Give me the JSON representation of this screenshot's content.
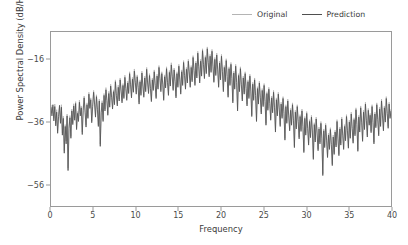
{
  "chart_data": {
    "type": "line",
    "title": "",
    "xlabel": "Frequency",
    "ylabel": "Power Spectral Density (dB/Hz)",
    "xlim": [
      0,
      40
    ],
    "ylim": [
      -63,
      -7
    ],
    "xticks": [
      0,
      5,
      10,
      15,
      20,
      25,
      30,
      35,
      40
    ],
    "xtick_labels": [
      "0",
      "5",
      "10",
      "15",
      "20",
      "25",
      "30",
      "35",
      "40"
    ],
    "yticks": [
      -16,
      -36,
      -56
    ],
    "ytick_labels": [
      "-16",
      "-36",
      "-56"
    ],
    "grid": false,
    "legend_position": "upper right",
    "series": [
      {
        "name": "Original",
        "color": "#b4b4b4",
        "linewidth": 0.8,
        "values": [
          -30.5,
          -33.2,
          -31.1,
          -34.8,
          -30.2,
          -36.4,
          -32.0,
          -38.9,
          -33.6,
          -31.2,
          -35.8,
          -30.4,
          -39.5,
          -34.1,
          -45.2,
          -36.8,
          -42.1,
          -33.4,
          -50.8,
          -37.2,
          -33.9,
          -40.6,
          -31.8,
          -36.2,
          -30.1,
          -34.7,
          -29.4,
          -37.8,
          -32.6,
          -35.1,
          -28.9,
          -33.4,
          -30.8,
          -39.2,
          -31.5,
          -27.6,
          -32.1,
          -36.9,
          -29.8,
          -34.2,
          -26.4,
          -31.0,
          -28.2,
          -35.6,
          -30.4,
          -25.8,
          -29.6,
          -33.8,
          -27.2,
          -31.4,
          -36.8,
          -28.6,
          -43.1,
          -32.4,
          -29.1,
          -35.2,
          -26.8,
          -31.8,
          -24.9,
          -28.4,
          -33.2,
          -26.1,
          -30.6,
          -23.8,
          -27.4,
          -31.2,
          -25.6,
          -29.8,
          -22.4,
          -26.8,
          -30.2,
          -24.1,
          -28.6,
          -21.8,
          -25.4,
          -29.2,
          -23.6,
          -27.8,
          -20.9,
          -24.6,
          -28.4,
          -22.8,
          -26.2,
          -19.8,
          -23.4,
          -27.6,
          -21.6,
          -25.8,
          -18.9,
          -22.6,
          -26.4,
          -20.8,
          -24.2,
          -29.6,
          -22.4,
          -26.8,
          -19.6,
          -23.8,
          -27.4,
          -21.2,
          -25.6,
          -18.4,
          -22.8,
          -26.2,
          -20.4,
          -24.6,
          -28.8,
          -21.8,
          -25.2,
          -19.2,
          -23.6,
          -27.8,
          -20.6,
          -24.8,
          -17.8,
          -21.4,
          -25.6,
          -19.8,
          -23.2,
          -28.4,
          -20.8,
          -24.4,
          -18.2,
          -22.6,
          -26.8,
          -19.4,
          -23.8,
          -16.9,
          -20.8,
          -25.2,
          -18.6,
          -22.4,
          -27.6,
          -19.8,
          -24.2,
          -17.4,
          -21.8,
          -26.4,
          -19.2,
          -23.6,
          -16.2,
          -20.4,
          -24.8,
          -18.4,
          -22.8,
          -15.8,
          -19.6,
          -24.2,
          -17.8,
          -22.4,
          -14.6,
          -18.8,
          -23.6,
          -16.4,
          -21.2,
          -13.2,
          -17.6,
          -22.8,
          -15.8,
          -20.6,
          -12.4,
          -16.8,
          -21.4,
          -14.6,
          -19.8,
          -11.8,
          -16.2,
          -20.8,
          -14.2,
          -19.4,
          -12.6,
          -17.4,
          -22.6,
          -15.2,
          -20.4,
          -13.8,
          -18.6,
          -24.2,
          -16.4,
          -21.8,
          -14.2,
          -19.2,
          -25.6,
          -17.8,
          -22.4,
          -15.6,
          -20.8,
          -27.4,
          -18.2,
          -23.6,
          -16.8,
          -21.4,
          -29.2,
          -19.6,
          -24.8,
          -17.4,
          -22.6,
          -31.8,
          -20.4,
          -25.6,
          -18.2,
          -23.4,
          -28.6,
          -21.2,
          -26.4,
          -19.8,
          -24.6,
          -30.2,
          -22.4,
          -27.8,
          -20.6,
          -25.4,
          -33.6,
          -23.2,
          -28.4,
          -21.8,
          -26.8,
          -35.2,
          -24.6,
          -29.6,
          -22.8,
          -27.4,
          -32.8,
          -25.2,
          -30.4,
          -23.6,
          -28.8,
          -36.4,
          -26.2,
          -31.6,
          -24.8,
          -29.4,
          -34.8,
          -27.6,
          -32.4,
          -25.8,
          -30.8,
          -38.6,
          -28.2,
          -33.4,
          -26.4,
          -31.2,
          -36.8,
          -29.6,
          -34.2,
          -27.8,
          -32.6,
          -41.2,
          -30.4,
          -35.8,
          -28.6,
          -33.4,
          -38.2,
          -31.6,
          -36.4,
          -29.8,
          -34.8,
          -43.6,
          -32.2,
          -37.6,
          -30.4,
          -35.2,
          -40.8,
          -33.6,
          -38.4,
          -31.8,
          -36.8,
          -45.2,
          -34.2,
          -39.6,
          -32.6,
          -37.4,
          -42.8,
          -35.2,
          -40.4,
          -33.8,
          -38.6,
          -47.4,
          -36.2,
          -41.8,
          -34.4,
          -39.2,
          -44.6,
          -37.6,
          -42.4,
          -35.8,
          -40.8,
          -52.6,
          -38.2,
          -43.6,
          -36.4,
          -41.2,
          -46.8,
          -39.6,
          -44.2,
          -37.8,
          -42.6,
          -49.4,
          -40.2,
          -45.8,
          -38.6,
          -43.4,
          -35.2,
          -40.8,
          -46.2,
          -37.6,
          -42.8,
          -34.4,
          -39.6,
          -44.2,
          -36.8,
          -41.4,
          -33.6,
          -38.2,
          -43.8,
          -35.4,
          -40.6,
          -32.8,
          -37.4,
          -42.2,
          -34.6,
          -39.8,
          -31.4,
          -36.2,
          -44.8,
          -33.8,
          -38.6,
          -30.8,
          -35.4,
          -41.6,
          -32.2,
          -37.8,
          -29.6,
          -34.8,
          -40.2,
          -31.6,
          -36.4,
          -33.2,
          -38.8,
          -30.4,
          -35.6,
          -42.4,
          -32.8,
          -37.2,
          -29.8,
          -34.6,
          -39.8,
          -31.2,
          -36.8,
          -28.6,
          -33.4,
          -38.2,
          -30.8,
          -35.4,
          -27.8,
          -32.6,
          -37.4,
          -29.6,
          -34.2,
          -31.8
        ]
      },
      {
        "name": "Prediction",
        "color": "#4f4f4f",
        "linewidth": 0.8,
        "values": [
          -31.2,
          -34.0,
          -30.4,
          -35.6,
          -31.0,
          -37.2,
          -32.8,
          -39.6,
          -34.2,
          -30.6,
          -36.4,
          -31.2,
          -40.2,
          -34.8,
          -46.0,
          -37.4,
          -43.0,
          -34.0,
          -51.6,
          -38.0,
          -34.6,
          -41.2,
          -32.4,
          -36.8,
          -30.8,
          -35.4,
          -30.0,
          -38.4,
          -33.2,
          -35.8,
          -29.6,
          -34.0,
          -31.4,
          -40.0,
          -32.2,
          -28.2,
          -32.8,
          -37.6,
          -30.4,
          -34.8,
          -27.0,
          -31.6,
          -28.8,
          -36.2,
          -31.0,
          -26.4,
          -30.2,
          -34.4,
          -27.8,
          -32.0,
          -37.4,
          -29.2,
          -43.8,
          -33.0,
          -29.8,
          -35.8,
          -27.4,
          -32.4,
          -25.6,
          -29.0,
          -33.8,
          -26.8,
          -31.2,
          -24.4,
          -28.0,
          -31.8,
          -26.2,
          -30.4,
          -23.0,
          -27.4,
          -30.8,
          -24.8,
          -29.2,
          -22.4,
          -26.0,
          -29.8,
          -24.2,
          -28.4,
          -21.6,
          -25.2,
          -29.0,
          -23.4,
          -26.8,
          -20.4,
          -24.0,
          -28.2,
          -22.2,
          -26.4,
          -19.6,
          -23.2,
          -27.0,
          -21.4,
          -24.8,
          -30.2,
          -23.0,
          -27.4,
          -20.2,
          -24.4,
          -28.0,
          -21.8,
          -26.2,
          -19.0,
          -23.4,
          -26.8,
          -21.0,
          -25.2,
          -29.4,
          -22.4,
          -25.8,
          -19.8,
          -24.2,
          -28.4,
          -21.2,
          -25.4,
          -18.4,
          -22.0,
          -26.2,
          -20.4,
          -23.8,
          -29.0,
          -21.4,
          -25.0,
          -18.8,
          -23.2,
          -27.4,
          -20.0,
          -24.4,
          -17.6,
          -21.4,
          -25.8,
          -19.2,
          -23.0,
          -28.2,
          -20.4,
          -24.8,
          -18.0,
          -22.4,
          -27.0,
          -19.8,
          -24.2,
          -16.8,
          -21.0,
          -25.4,
          -19.0,
          -23.4,
          -16.4,
          -20.2,
          -24.8,
          -18.4,
          -23.0,
          -15.2,
          -19.4,
          -24.2,
          -17.0,
          -21.8,
          -13.8,
          -18.2,
          -23.4,
          -16.4,
          -21.2,
          -13.0,
          -17.4,
          -22.0,
          -15.2,
          -20.4,
          -12.4,
          -16.8,
          -21.4,
          -14.8,
          -20.0,
          -13.2,
          -18.0,
          -23.2,
          -15.8,
          -21.0,
          -14.4,
          -19.2,
          -24.8,
          -17.0,
          -22.4,
          -14.8,
          -19.8,
          -26.2,
          -18.4,
          -23.0,
          -16.2,
          -21.4,
          -28.0,
          -18.8,
          -24.2,
          -17.4,
          -22.0,
          -29.8,
          -20.2,
          -25.4,
          -18.0,
          -23.2,
          -32.4,
          -21.0,
          -26.2,
          -18.8,
          -24.0,
          -29.2,
          -21.8,
          -27.0,
          -20.4,
          -25.2,
          -30.8,
          -23.0,
          -28.4,
          -21.2,
          -26.0,
          -34.2,
          -23.8,
          -29.0,
          -22.4,
          -27.4,
          -35.8,
          -25.2,
          -30.2,
          -23.4,
          -28.0,
          -33.4,
          -25.8,
          -31.0,
          -24.2,
          -29.4,
          -37.0,
          -26.8,
          -32.2,
          -25.4,
          -30.0,
          -35.4,
          -28.2,
          -33.0,
          -26.4,
          -31.4,
          -39.2,
          -28.8,
          -34.0,
          -27.0,
          -31.8,
          -37.4,
          -30.2,
          -34.8,
          -28.4,
          -33.2,
          -41.8,
          -31.0,
          -36.4,
          -29.2,
          -34.0,
          -38.8,
          -32.2,
          -37.0,
          -30.4,
          -35.4,
          -44.2,
          -32.8,
          -38.2,
          -31.0,
          -35.8,
          -41.4,
          -34.2,
          -39.0,
          -32.4,
          -37.4,
          -45.8,
          -34.8,
          -40.2,
          -33.2,
          -38.0,
          -43.4,
          -35.8,
          -41.0,
          -34.4,
          -39.2,
          -48.0,
          -36.8,
          -42.4,
          -35.0,
          -39.8,
          -45.2,
          -38.2,
          -43.0,
          -36.4,
          -41.4,
          -53.2,
          -38.8,
          -44.2,
          -37.0,
          -41.8,
          -47.4,
          -40.2,
          -44.8,
          -38.4,
          -43.2,
          -50.0,
          -40.8,
          -46.4,
          -39.2,
          -44.0,
          -35.8,
          -41.4,
          -46.8,
          -38.2,
          -43.4,
          -35.0,
          -40.2,
          -44.8,
          -37.4,
          -42.0,
          -34.2,
          -38.8,
          -44.4,
          -36.0,
          -41.2,
          -33.4,
          -38.0,
          -42.8,
          -35.2,
          -40.4,
          -32.0,
          -36.8,
          -45.4,
          -34.4,
          -39.2,
          -31.4,
          -36.0,
          -42.2,
          -32.8,
          -38.4,
          -30.2,
          -35.4,
          -40.8,
          -32.2,
          -37.0,
          -33.8,
          -39.4,
          -31.0,
          -36.2,
          -43.0,
          -33.4,
          -37.8,
          -30.4,
          -35.2,
          -40.4,
          -31.8,
          -37.4,
          -29.2,
          -34.0,
          -38.8,
          -31.4,
          -36.0,
          -28.4,
          -33.2,
          -38.0,
          -30.2,
          -34.8,
          -32.4
        ]
      }
    ]
  },
  "legend": {
    "entries": [
      {
        "label": "Original"
      },
      {
        "label": "Prediction"
      }
    ]
  }
}
